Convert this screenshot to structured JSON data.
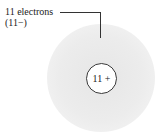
{
  "diagram": {
    "electron_label": "11 electrons",
    "electron_charge": "(11−)",
    "nucleus_label": "11 +",
    "colors": {
      "cloud": "#ebebeb",
      "nucleus_fill": "#ffffff",
      "nucleus_stroke": "#3a3a3a",
      "text": "#222222"
    }
  }
}
